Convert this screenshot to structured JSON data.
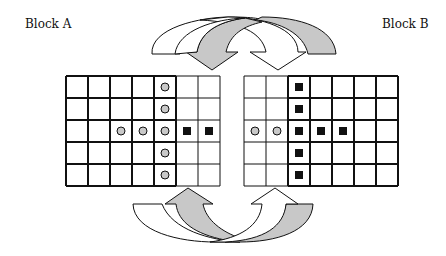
{
  "labels": {
    "block_a": "Block A",
    "block_b": "Block B"
  },
  "colors": {
    "gray_fill": "#c8c8c8",
    "line": "#111111",
    "square": "#111111"
  },
  "grid": {
    "rows": 5,
    "cols": 7,
    "cell": 22
  },
  "block_a": {
    "x": 66,
    "y": 76,
    "bold_region": {
      "col_start": 0,
      "col_end": 5
    },
    "circles": [
      [
        0,
        4
      ],
      [
        1,
        4
      ],
      [
        2,
        2
      ],
      [
        2,
        3
      ],
      [
        2,
        4
      ],
      [
        3,
        4
      ],
      [
        4,
        4
      ]
    ],
    "squares": [
      [
        2,
        5
      ],
      [
        2,
        6
      ]
    ]
  },
  "block_b": {
    "x": 244,
    "y": 76,
    "bold_region": {
      "col_start": 2,
      "col_end": 7
    },
    "circles": [
      [
        2,
        0
      ],
      [
        2,
        1
      ]
    ],
    "squares": [
      [
        0,
        2
      ],
      [
        1,
        2
      ],
      [
        2,
        2
      ],
      [
        2,
        3
      ],
      [
        2,
        4
      ],
      [
        3,
        2
      ],
      [
        4,
        2
      ]
    ]
  }
}
